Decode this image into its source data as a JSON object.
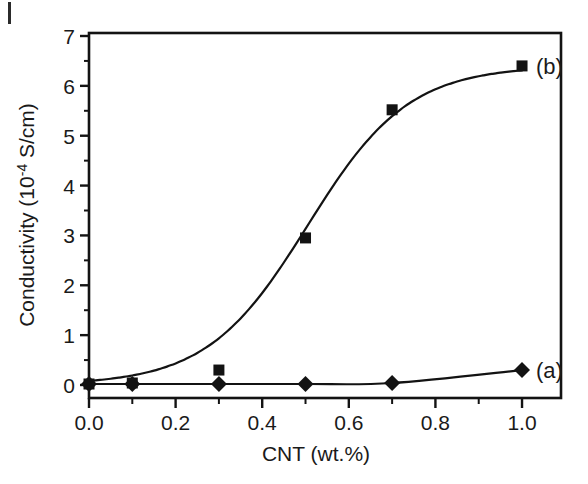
{
  "chart_data": {
    "type": "line",
    "title": "",
    "xlabel": "CNT (wt.%)",
    "ylabel_prefix": "Conductivity (10",
    "ylabel_exponent": "-4",
    "ylabel_suffix": " S/cm)",
    "ylabel_full": "Conductivity (10-4 S/cm)",
    "xlim": [
      0.0,
      1.09
    ],
    "ylim": [
      0,
      7
    ],
    "grid": false,
    "legend_position": "inline-annotations",
    "x_ticks": [
      "0.0",
      "0.2",
      "0.4",
      "0.6",
      "0.8",
      "1.0"
    ],
    "x_tick_values": [
      0.0,
      0.2,
      0.4,
      0.6,
      0.8,
      1.0
    ],
    "x_minor_tick_values": [
      0.1,
      0.3,
      0.5,
      0.7,
      0.9
    ],
    "y_ticks": [
      "0",
      "1",
      "2",
      "3",
      "4",
      "5",
      "6",
      "7"
    ],
    "y_tick_values": [
      0,
      1,
      2,
      3,
      4,
      5,
      6,
      7
    ],
    "y_minor_tick_values": [
      0.5,
      1.5,
      2.5,
      3.5,
      4.5,
      5.5,
      6.5
    ],
    "series": [
      {
        "name": "(a)",
        "marker": "diamond",
        "color": "#131313",
        "annotation": "(a)",
        "x": [
          0.0,
          0.1,
          0.3,
          0.5,
          0.7,
          1.0
        ],
        "values": [
          0.02,
          0.02,
          0.02,
          0.02,
          0.04,
          0.3
        ]
      },
      {
        "name": "(b)",
        "marker": "square",
        "color": "#131313",
        "annotation": "(b)",
        "x": [
          0.0,
          0.1,
          0.3,
          0.5,
          0.7,
          1.0
        ],
        "values": [
          0.02,
          0.04,
          0.3,
          2.95,
          5.52,
          6.4
        ]
      }
    ]
  },
  "figure": {
    "background_color": "#ffffff",
    "axis_color": "#131313",
    "text_color": "#1a1a1a"
  }
}
